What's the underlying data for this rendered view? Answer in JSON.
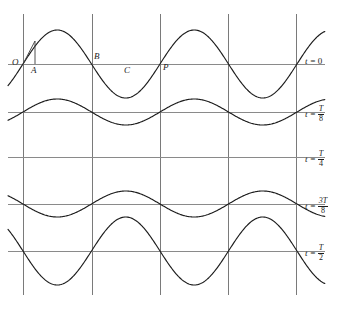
{
  "figure": {
    "background_color": "#ffffff",
    "curve_color": "#1c1c1c",
    "grid_color": "#7a7a7a",
    "baseline_color": "#8a8a8a"
  },
  "point_labels": [
    {
      "text": "O",
      "x": 12,
      "y": 58
    },
    {
      "text": "A",
      "x": 31,
      "y": 66
    },
    {
      "text": "B",
      "x": 94,
      "y": 52
    },
    {
      "text": "C",
      "x": 124,
      "y": 66
    },
    {
      "text": "P",
      "x": 163,
      "y": 63
    }
  ],
  "time_labels": [
    {
      "lhs": "t =",
      "value": "0",
      "numerator": "",
      "denominator": "",
      "is_fraction": false,
      "y": 64
    },
    {
      "lhs": "t =",
      "value": "",
      "numerator": "T",
      "denominator": "8",
      "is_fraction": true,
      "y": 112
    },
    {
      "lhs": "t =",
      "value": "",
      "numerator": "T",
      "denominator": "4",
      "is_fraction": true,
      "y": 157
    },
    {
      "lhs": "t =",
      "value": "",
      "numerator": "3T",
      "denominator": "8",
      "is_fraction": true,
      "y": 204
    },
    {
      "lhs": "t =",
      "value": "",
      "numerator": "T",
      "denominator": "2",
      "is_fraction": true,
      "y": 251
    }
  ],
  "chart_data": {
    "type": "line",
    "xlabel": "",
    "ylabel": "",
    "grid": true,
    "legend_position": "right",
    "x_range_px": [
      8,
      325
    ],
    "vertical_grid_x": [
      23,
      92,
      160,
      228,
      296
    ],
    "baselines_y": [
      64,
      112,
      157,
      204,
      251
    ],
    "wavelength_px": 137,
    "phase_origin_px": 23,
    "max_amplitude_px": 34,
    "series": [
      {
        "name": "t = 0",
        "time": "0",
        "amplitude_ratio": 1.0,
        "amplitude_px": 34,
        "baseline_y": 64,
        "sign": 1,
        "description": "full positive sine, crest first"
      },
      {
        "name": "t = T/8",
        "time": "T/8",
        "amplitude_ratio": 0.383,
        "amplitude_px": 13,
        "baseline_y": 112,
        "sign": 1,
        "description": "reduced positive sine"
      },
      {
        "name": "t = T/4",
        "time": "T/4",
        "amplitude_ratio": 0.0,
        "amplitude_px": 0,
        "baseline_y": 157,
        "sign": 1,
        "description": "flat, zero displacement everywhere"
      },
      {
        "name": "t = 3T/8",
        "time": "3T/8",
        "amplitude_ratio": 0.383,
        "amplitude_px": 13,
        "baseline_y": 204,
        "sign": -1,
        "description": "reduced inverted sine, trough first"
      },
      {
        "name": "t = T/2",
        "time": "T/2",
        "amplitude_ratio": 1.0,
        "amplitude_px": 34,
        "baseline_y": 251,
        "sign": -1,
        "description": "full inverted sine, trough first"
      }
    ],
    "annotations": [
      {
        "label": "O",
        "meaning": "origin on first baseline",
        "x_px": 23,
        "y_px": 64
      },
      {
        "label": "A",
        "meaning": "point just right of origin",
        "x_px": 31,
        "y_px": 64
      },
      {
        "label": "B",
        "meaning": "node at first grid crossing",
        "x_px": 92,
        "y_px": 64
      },
      {
        "label": "C",
        "meaning": "mid antinode region",
        "x_px": 126,
        "y_px": 64
      },
      {
        "label": "P",
        "meaning": "node at second grid crossing",
        "x_px": 160,
        "y_px": 64
      }
    ]
  }
}
